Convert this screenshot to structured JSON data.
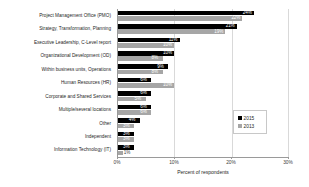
{
  "chart_data": {
    "type": "bar",
    "orientation": "horizontal",
    "title": "",
    "xlabel": "Percent of respondents",
    "ylabel": "",
    "xlim": [
      0,
      30
    ],
    "xticks": [
      "0%",
      "10%",
      "20%",
      "30%"
    ],
    "xtick_values": [
      0,
      10,
      20,
      30
    ],
    "grid": true,
    "grid_axis": "x",
    "legend_position": "right",
    "categories": [
      "Project Management Office  (PMO)",
      "Strategy, Transformation, Planning",
      "Executive Leadership, C-Level report",
      "Organizational Development (OD)",
      "Within business units, Operations",
      "Human Resources (HR)",
      "Corporate and Shared Services",
      "Multiple/several locations",
      "Other",
      "Independent",
      "Information Technology (IT)"
    ],
    "series": [
      {
        "name": "2015",
        "color": "#000000",
        "values": [
          24,
          21,
          11,
          10,
          9,
          6,
          6,
          6,
          4,
          3,
          3
        ],
        "labels": [
          "24%",
          "21%",
          "11%",
          "10%",
          "9%",
          "6%",
          "6%",
          "6%",
          "4%",
          "3%",
          "3%"
        ]
      },
      {
        "name": "2013",
        "color": "#a6a6a6",
        "values": [
          22,
          19,
          10,
          8,
          8,
          10,
          5,
          6,
          3,
          3,
          1
        ],
        "labels": [
          "22%",
          "19%",
          "10%",
          "8%",
          "8%",
          "10%",
          "5%",
          "6%",
          "3%",
          "3%",
          "1%"
        ]
      }
    ]
  },
  "legend": {
    "entries": [
      {
        "label": "2015",
        "color": "#000000"
      },
      {
        "label": "2013",
        "color": "#a6a6a6"
      }
    ]
  }
}
